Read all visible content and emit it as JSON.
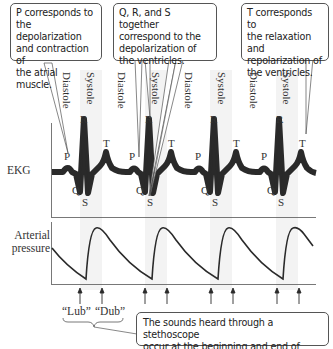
{
  "callouts": {
    "p_wave": "P corresponds to\nthe depolarization\nand contraction of\nthe atrial muscle.",
    "qrs": "Q, R, and S together\ncorrespond to the\ndepolarization of\nthe ventricles.",
    "t_wave": "T corresponds to\nthe relaxation and\nrepolarization of\nthe ventricles.",
    "sounds": "The sounds heard through a stethoscope\noccur at the beginning and end of systole."
  },
  "phases": [
    "Diastole",
    "Systole",
    "Diastole",
    "Systole",
    "Diastole",
    "Systole",
    "Diastole",
    "Systole"
  ],
  "traces": {
    "ekg_label": "EKG",
    "pressure_label": "Arterial\npressure"
  },
  "waves": {
    "p": "P",
    "q": "Q",
    "r": "R",
    "s": "S",
    "t": "T"
  },
  "sounds": {
    "lub": "“Lub”",
    "dub": "“Dub”"
  },
  "colors": {
    "trace": "#2a2a2a",
    "systole_band": "#f2f2f2",
    "callout_border": "#555555"
  }
}
